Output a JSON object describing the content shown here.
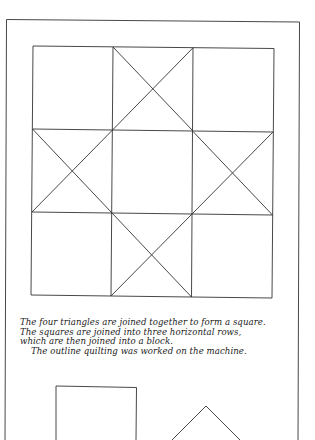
{
  "figure": {
    "stroke_color": "#333333",
    "grid": {
      "rows": 3,
      "cols": 3,
      "crossed_cells": [
        [
          0,
          1
        ],
        [
          1,
          0
        ],
        [
          1,
          2
        ],
        [
          2,
          1
        ]
      ]
    }
  },
  "caption": {
    "lines": [
      "The four triangles are joined together to form a square.",
      "The squares are joined into three horizontal rows,",
      "which are then joined into a block.",
      "The outline quilting was worked on the machine."
    ]
  },
  "templates": {
    "shapes": [
      "square",
      "triangle"
    ]
  }
}
